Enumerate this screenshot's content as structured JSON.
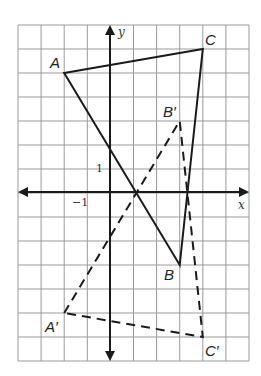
{
  "diagram": {
    "type": "coordinate-plane-transformation",
    "grid": {
      "x_min": -4,
      "x_max": 6,
      "y_min": -7,
      "y_max": 7
    },
    "axes": {
      "x_label": "x",
      "y_label": "y"
    },
    "ticks": {
      "x_tick": "−1",
      "y_tick": "1"
    },
    "triangle_original": {
      "style": "solid",
      "vertices": [
        {
          "name": "A",
          "x": -2,
          "y": 5
        },
        {
          "name": "C",
          "x": 4,
          "y": 6
        },
        {
          "name": "B",
          "x": 3,
          "y": -3
        }
      ]
    },
    "triangle_image": {
      "style": "dashed",
      "vertices": [
        {
          "name": "A′",
          "x": -2,
          "y": -5
        },
        {
          "name": "B′",
          "x": 3,
          "y": 3
        },
        {
          "name": "C′",
          "x": 4,
          "y": -6
        }
      ]
    },
    "colors": {
      "grid": "#9a9a9a",
      "lines": "#1a1a1a"
    }
  }
}
